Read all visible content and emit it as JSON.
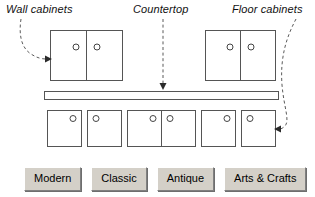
{
  "diagram": {
    "annotations": {
      "wall_cabinets": "Wall cabinets",
      "countertop": "Countertop",
      "floor_cabinets": "Floor cabinets"
    },
    "colors": {
      "outline": "#555555",
      "leader_line": "#5a5a5a",
      "arrow_head": "#2b2b2b",
      "cabinet_fill": "#ffffff",
      "button_face": "#d4d0c8",
      "page_background": "#ffffff"
    },
    "wall_cabinets": [
      {
        "name": "wall-cabinet-left",
        "x": 50,
        "y": 30,
        "width": 72,
        "height": 50,
        "doors": 2,
        "knobs": 2
      },
      {
        "name": "wall-cabinet-right",
        "x": 205,
        "y": 30,
        "width": 70,
        "height": 50,
        "doors": 2,
        "knobs": 2
      }
    ],
    "countertop": {
      "x": 44,
      "y": 91,
      "width": 234,
      "height": 8
    },
    "floor_cabinets": [
      {
        "name": "floor-cabinet-1",
        "x": 47,
        "y": 110,
        "width": 34,
        "height": 36,
        "doors": 1,
        "knob_side": "right"
      },
      {
        "name": "floor-cabinet-2",
        "x": 87,
        "y": 110,
        "width": 34,
        "height": 36,
        "doors": 1,
        "knob_side": "left"
      },
      {
        "name": "floor-cabinet-3",
        "x": 127,
        "y": 110,
        "width": 68,
        "height": 36,
        "doors": 2,
        "knob_side": "both"
      },
      {
        "name": "floor-cabinet-4",
        "x": 201,
        "y": 110,
        "width": 34,
        "height": 36,
        "doors": 1,
        "knob_side": "right"
      },
      {
        "name": "floor-cabinet-5",
        "x": 241,
        "y": 110,
        "width": 34,
        "height": 36,
        "doors": 1,
        "knob_side": "left"
      }
    ],
    "leaders": [
      {
        "name": "leader-wall-cabinets",
        "style": "curved-dashed",
        "arrow_direction": "right"
      },
      {
        "name": "leader-countertop",
        "style": "straight-dashed",
        "arrow_direction": "down"
      },
      {
        "name": "leader-floor-cabinets",
        "style": "curved-dashed",
        "arrow_direction": "left"
      }
    ]
  },
  "buttonbar": {
    "buttons": [
      {
        "label": "Modern",
        "name": "style-button-modern"
      },
      {
        "label": "Classic",
        "name": "style-button-classic"
      },
      {
        "label": "Antique",
        "name": "style-button-antique"
      },
      {
        "label": "Arts & Crafts",
        "name": "style-button-arts-crafts"
      }
    ]
  }
}
